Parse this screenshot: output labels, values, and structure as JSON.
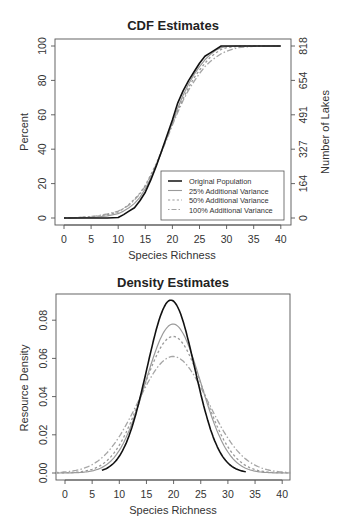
{
  "chart_data": [
    {
      "type": "line",
      "title": "CDF Estimates",
      "xlabel": "Species Richness",
      "ylabel": "Percent",
      "ylabel_right": "Number of Lakes",
      "xlim": [
        0,
        40
      ],
      "ylim": [
        0,
        100
      ],
      "x_ticks": [
        0,
        5,
        10,
        15,
        20,
        25,
        30,
        35,
        40
      ],
      "y_ticks": [
        0,
        20,
        40,
        60,
        80,
        100
      ],
      "y_ticks_right": [
        0,
        164,
        327,
        491,
        654,
        818
      ],
      "grid": false,
      "legend_position": "bottom-right",
      "x": [
        0,
        2,
        4,
        6,
        8,
        10,
        11,
        12,
        13,
        14,
        15,
        16,
        17,
        18,
        19,
        20,
        21,
        22,
        23,
        24,
        25,
        26,
        27,
        28,
        29,
        30,
        32,
        35,
        40
      ],
      "series": [
        {
          "name": "Original Population",
          "style": "solid",
          "color": "#111111",
          "width": 1.6,
          "values": [
            0,
            0,
            0,
            0,
            0,
            0.3,
            2,
            4,
            6,
            10,
            15,
            22,
            30,
            39,
            48,
            57,
            67,
            74,
            80,
            85,
            90,
            94,
            96,
            98,
            100,
            100,
            100,
            100,
            100
          ]
        },
        {
          "name": "25% Additional Variance",
          "style": "solid",
          "color": "#9a9a9a",
          "width": 1.2,
          "values": [
            0,
            0,
            0.3,
            0.6,
            1.2,
            2.5,
            4,
            6,
            8.5,
            12,
            17,
            23,
            30.5,
            38.5,
            47,
            55.5,
            64,
            71.5,
            78,
            83.5,
            88,
            92,
            95,
            97.5,
            99,
            99.7,
            100,
            100,
            100
          ]
        },
        {
          "name": "50% Additional Variance",
          "style": "dotted",
          "color": "#9a9a9a",
          "width": 1.3,
          "values": [
            0,
            0.2,
            0.5,
            1,
            2,
            3.5,
            5.5,
            8,
            11,
            14.5,
            19,
            25,
            31.5,
            39,
            47,
            55,
            62.5,
            69.5,
            76,
            81.5,
            86,
            90,
            93.5,
            96,
            98,
            99,
            99.8,
            100,
            100
          ]
        },
        {
          "name": "100% Additional Variance",
          "style": "dashdot",
          "color": "#a5a5a5",
          "width": 1.3,
          "values": [
            0,
            0.2,
            0.6,
            1.2,
            2.3,
            4,
            5.5,
            7.5,
            10.5,
            14,
            18.5,
            24.5,
            31,
            38.5,
            46,
            54,
            61.5,
            68.5,
            74.5,
            79.5,
            84,
            88,
            91,
            93.5,
            95.5,
            97,
            99,
            99.8,
            100
          ]
        }
      ]
    },
    {
      "type": "line",
      "title": "Density Estimates",
      "xlabel": "Species Richness",
      "ylabel": "Resource Density",
      "xlim": [
        -1.5,
        41.5
      ],
      "ylim": [
        0,
        0.093
      ],
      "x_ticks": [
        0,
        5,
        10,
        15,
        20,
        25,
        30,
        35,
        40
      ],
      "y_ticks": [
        "0.00",
        "0.02",
        "0.04",
        "0.06",
        "0.08"
      ],
      "grid": false,
      "series": [
        {
          "name": "Original Population",
          "style": "solid",
          "color": "#111111",
          "width": 1.6,
          "peak_x": 19.5,
          "peak_y": 0.0905,
          "x_range": [
            6.8,
            33.5
          ],
          "sd": 4.4
        },
        {
          "name": "25% Additional Variance",
          "style": "solid",
          "color": "#9a9a9a",
          "width": 1.2,
          "peak_x": 19.9,
          "peak_y": 0.078,
          "x_range": [
            -1.5,
            41.5
          ],
          "sd": 5.1
        },
        {
          "name": "50% Additional Variance",
          "style": "dotted",
          "color": "#9a9a9a",
          "width": 1.3,
          "peak_x": 19.9,
          "peak_y": 0.0715,
          "x_range": [
            -1.5,
            41.5
          ],
          "sd": 5.55
        },
        {
          "name": "100% Additional Variance",
          "style": "dashdot",
          "color": "#a5a5a5",
          "width": 1.3,
          "peak_x": 19.9,
          "peak_y": 0.061,
          "x_range": [
            -1.5,
            41.5
          ],
          "sd": 6.5
        }
      ]
    }
  ]
}
